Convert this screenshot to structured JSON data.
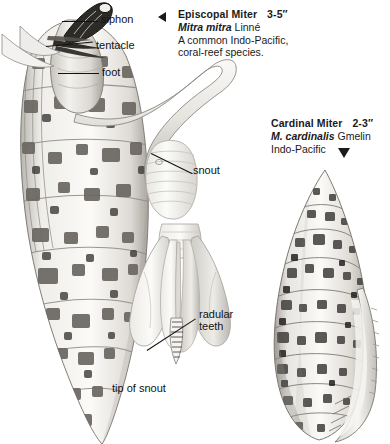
{
  "plate": {
    "background_color": "#ffffff",
    "ink_color": "#1a1a1a"
  },
  "species": [
    {
      "id": "episcopal-miter",
      "common_name": "Episcopal Miter",
      "size": "3-5″",
      "scientific_name": "Mitra mitra",
      "authority": "Linné",
      "description_line_1": "A common Indo-Pacific,",
      "description_line_2": "coral-reef species.",
      "pointer": "triangle-left"
    },
    {
      "id": "cardinal-miter",
      "common_name": "Cardinal Miter",
      "size": "2-3″",
      "scientific_name": "M. cardinalis",
      "authority": "Gmelin",
      "description_line_1": "Indo-Pacific",
      "description_line_2": "",
      "pointer": "triangle-down"
    }
  ],
  "callouts": [
    {
      "id": "siphon",
      "label": "siphon"
    },
    {
      "id": "tentacle",
      "label": "tentacle"
    },
    {
      "id": "foot",
      "label": "foot"
    },
    {
      "id": "snout",
      "label": "snout"
    },
    {
      "id": "radular",
      "label_line_1": "radular",
      "label_line_2": "teeth"
    },
    {
      "id": "tip",
      "label": "tip of snout"
    }
  ],
  "figures": [
    {
      "id": "episcopal-animal",
      "caption": "Episcopal Miter shell with extended animal, snout, siphon, tentacle and foot"
    },
    {
      "id": "snout-detail",
      "caption": "Detail of snout"
    },
    {
      "id": "radula-detail",
      "caption": "Tip of snout showing radular teeth"
    },
    {
      "id": "cardinal-shell",
      "caption": "Cardinal Miter shell"
    }
  ]
}
